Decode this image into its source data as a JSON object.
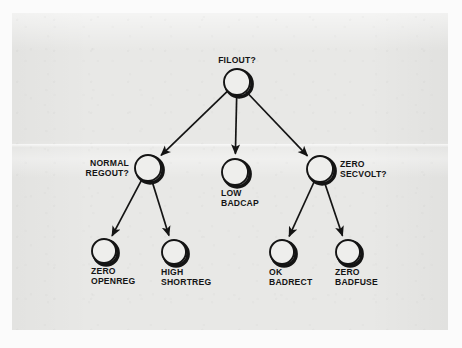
{
  "figure": {
    "type": "decision-tree",
    "background_color": "#e8e8e6",
    "ink_color": "#141414"
  },
  "nodes": [
    {
      "id": "root",
      "label_lines": [
        "FILOUT?"
      ],
      "label_position": "above",
      "cx": 237,
      "cy": 82,
      "r": 13
    },
    {
      "id": "normal-regout",
      "label_lines": [
        "NORMAL",
        "REGOUT?"
      ],
      "label_position": "left",
      "cx": 148,
      "cy": 168,
      "r": 13
    },
    {
      "id": "low-badcap",
      "label_lines": [
        "LOW",
        "BADCAP"
      ],
      "label_position": "below",
      "cx": 235,
      "cy": 172,
      "r": 13
    },
    {
      "id": "zero-secvolt",
      "label_lines": [
        "ZERO",
        "SECVOLT?"
      ],
      "label_position": "right",
      "cx": 320,
      "cy": 169,
      "r": 13
    },
    {
      "id": "zero-openreg",
      "label_lines": [
        "ZERO",
        "OPENREG"
      ],
      "label_position": "below",
      "cx": 104,
      "cy": 251,
      "r": 12
    },
    {
      "id": "high-shortreg",
      "label_lines": [
        "HIGH",
        "SHORTREG"
      ],
      "label_position": "below",
      "cx": 174,
      "cy": 252,
      "r": 12
    },
    {
      "id": "ok-badrect",
      "label_lines": [
        "OK",
        "BADRECT"
      ],
      "label_position": "below",
      "cx": 282,
      "cy": 252,
      "r": 12
    },
    {
      "id": "zero-badfuse",
      "label_lines": [
        "ZERO",
        "BADFUSE"
      ],
      "label_position": "below",
      "cx": 348,
      "cy": 252,
      "r": 12
    }
  ],
  "edges": [
    {
      "id": "root-to-normal-regout",
      "from": "root",
      "to": "normal-regout"
    },
    {
      "id": "root-to-low-badcap",
      "from": "root",
      "to": "low-badcap"
    },
    {
      "id": "root-to-zero-secvolt",
      "from": "root",
      "to": "zero-secvolt"
    },
    {
      "id": "normal-regout-to-zero-openreg",
      "from": "normal-regout",
      "to": "zero-openreg"
    },
    {
      "id": "normal-regout-to-high-shortreg",
      "from": "normal-regout",
      "to": "high-shortreg"
    },
    {
      "id": "zero-secvolt-to-ok-badrect",
      "from": "zero-secvolt",
      "to": "ok-badrect"
    },
    {
      "id": "zero-secvolt-to-zero-badfuse",
      "from": "zero-secvolt",
      "to": "zero-badfuse"
    }
  ]
}
